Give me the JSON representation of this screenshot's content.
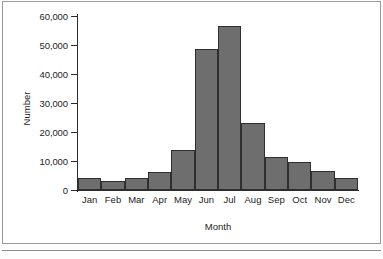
{
  "chart_data": {
    "type": "bar",
    "title": "",
    "xlabel": "Month",
    "ylabel": "Number",
    "categories": [
      "Jan",
      "Feb",
      "Mar",
      "Apr",
      "May",
      "Jun",
      "Jul",
      "Aug",
      "Sep",
      "Oct",
      "Nov",
      "Dec"
    ],
    "values": [
      4100,
      3200,
      4200,
      6100,
      13700,
      48700,
      56600,
      23100,
      11400,
      9700,
      6600,
      4000
    ],
    "ylim": [
      0,
      60000
    ],
    "yticks": [
      0,
      10000,
      20000,
      30000,
      40000,
      50000,
      60000
    ],
    "ytick_labels": [
      "0",
      "10,000",
      "20,000",
      "30,000",
      "40,000",
      "50,000",
      "60,000"
    ],
    "grid": false,
    "legend": null,
    "bar_fill_color": "#6e6e6e",
    "bar_edge_color": "#2f2f2f",
    "axis_color": "#2b2b2b"
  }
}
